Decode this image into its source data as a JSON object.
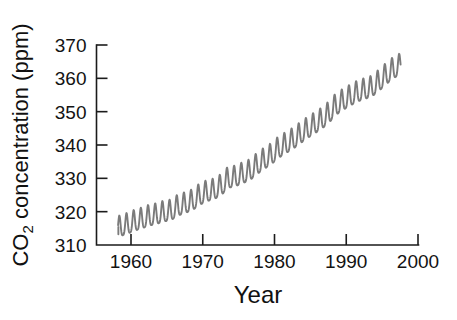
{
  "chart_data": {
    "type": "line",
    "title": "",
    "subtitle": "",
    "xlabel": "Year",
    "ylabel_text": "CO2 concentration (ppm)",
    "ylabel_prefix": "CO",
    "ylabel_subscript": "2",
    "ylabel_suffix": " concentration (ppm)",
    "xlim": [
      1956.0,
      2002.0
    ],
    "ylim": [
      310,
      370
    ],
    "xticks": [
      1960,
      1970,
      1980,
      1990,
      2000
    ],
    "xtick_labels": [
      "1960",
      "1970",
      "1980",
      "1990",
      "2000"
    ],
    "yticks": [
      310,
      320,
      330,
      340,
      350,
      360,
      370
    ],
    "ytick_labels": [
      "310",
      "320",
      "330",
      "340",
      "350",
      "360",
      "370"
    ],
    "grid": false,
    "legend": false,
    "legend_position": "none",
    "line_color": "#7b7b7b",
    "axis_color": "#1b1b1b",
    "background_color": "#ffffff",
    "series": [
      {
        "name": "Atmospheric CO2 (Mauna Loa monthly mean)",
        "color": "#7b7b7b",
        "x_start": 1958.2,
        "x_end": 1997.6,
        "annual_trend_anchors": [
          {
            "year": 1958.5,
            "value": 315.3
          },
          {
            "year": 1959.5,
            "value": 316.0
          },
          {
            "year": 1960.5,
            "value": 316.9
          },
          {
            "year": 1961.5,
            "value": 317.6
          },
          {
            "year": 1962.5,
            "value": 318.4
          },
          {
            "year": 1963.5,
            "value": 318.9
          },
          {
            "year": 1964.5,
            "value": 319.6
          },
          {
            "year": 1965.5,
            "value": 320.0
          },
          {
            "year": 1966.5,
            "value": 321.4
          },
          {
            "year": 1967.5,
            "value": 322.2
          },
          {
            "year": 1968.5,
            "value": 323.0
          },
          {
            "year": 1969.5,
            "value": 324.6
          },
          {
            "year": 1970.5,
            "value": 325.7
          },
          {
            "year": 1971.5,
            "value": 326.3
          },
          {
            "year": 1972.5,
            "value": 327.5
          },
          {
            "year": 1973.5,
            "value": 329.7
          },
          {
            "year": 1974.5,
            "value": 330.2
          },
          {
            "year": 1975.5,
            "value": 331.1
          },
          {
            "year": 1976.5,
            "value": 332.0
          },
          {
            "year": 1977.5,
            "value": 333.8
          },
          {
            "year": 1978.5,
            "value": 335.4
          },
          {
            "year": 1979.5,
            "value": 336.8
          },
          {
            "year": 1980.5,
            "value": 338.7
          },
          {
            "year": 1981.5,
            "value": 340.1
          },
          {
            "year": 1982.5,
            "value": 341.4
          },
          {
            "year": 1983.5,
            "value": 343.0
          },
          {
            "year": 1984.5,
            "value": 344.6
          },
          {
            "year": 1985.5,
            "value": 346.0
          },
          {
            "year": 1986.5,
            "value": 347.4
          },
          {
            "year": 1987.5,
            "value": 349.2
          },
          {
            "year": 1988.5,
            "value": 351.6
          },
          {
            "year": 1989.5,
            "value": 353.1
          },
          {
            "year": 1990.5,
            "value": 354.4
          },
          {
            "year": 1991.5,
            "value": 355.6
          },
          {
            "year": 1992.5,
            "value": 356.4
          },
          {
            "year": 1993.5,
            "value": 357.1
          },
          {
            "year": 1994.5,
            "value": 358.8
          },
          {
            "year": 1995.5,
            "value": 360.8
          },
          {
            "year": 1996.5,
            "value": 362.6
          },
          {
            "year": 1997.5,
            "value": 363.8
          }
        ],
        "seasonal_amplitude_ppm": 3.1,
        "seasonal_peak_month": 5,
        "start_value_ppm": 315.3,
        "end_value_ppm": 362.0,
        "max_value_ppm": 366.0,
        "min_value_ppm": 313.2
      }
    ]
  }
}
